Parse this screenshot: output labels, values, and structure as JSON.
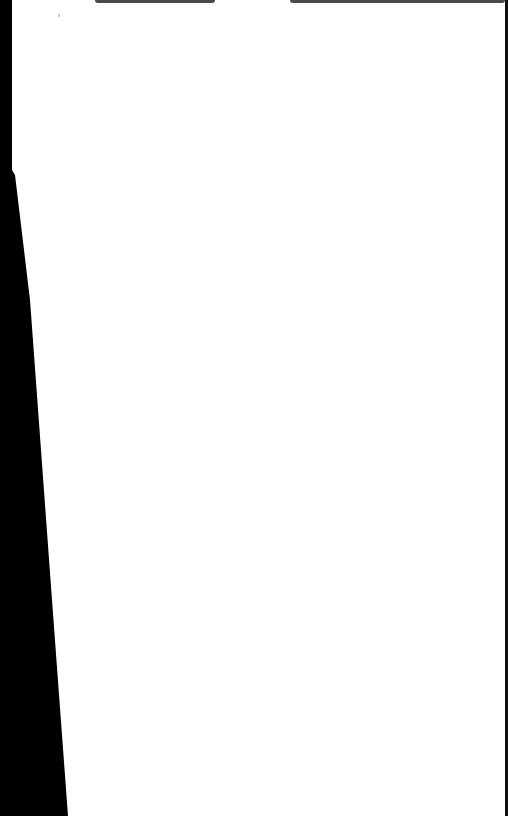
{
  "document": {
    "type": "scanned-blank-page",
    "page_color": "#ffffff",
    "background_color": "#000000",
    "text_content": ""
  }
}
